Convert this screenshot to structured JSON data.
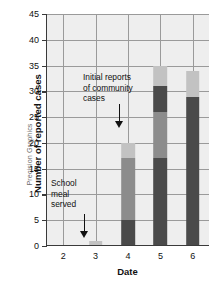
{
  "chart_data": {
    "type": "bar",
    "stacked": true,
    "title": "",
    "xlabel": "Date",
    "ylabel": "Number of reported cases",
    "categories": [
      "2",
      "3",
      "4",
      "5",
      "6"
    ],
    "ylim": [
      0,
      45
    ],
    "ytick_step": 5,
    "yticks": [
      "0",
      "5",
      "10",
      "15",
      "20",
      "25",
      "30",
      "35",
      "40",
      "45"
    ],
    "grid": true,
    "legend": "none",
    "series": [
      {
        "name": "segment-1",
        "color": "#4a4a4a",
        "values": [
          0,
          0,
          5,
          17,
          24
        ]
      },
      {
        "name": "segment-2",
        "color": "#8c8c8c",
        "values": [
          0,
          0,
          12,
          9,
          0
        ]
      },
      {
        "name": "segment-3",
        "color": "#4a4a4a",
        "values": [
          0,
          0,
          0,
          5,
          5
        ]
      },
      {
        "name": "segment-4",
        "color": "#c2c2c2",
        "values": [
          0,
          1,
          3,
          4,
          5
        ]
      }
    ],
    "totals": [
      0,
      1,
      20,
      35,
      34
    ],
    "annotations": [
      {
        "name": "school-meal",
        "text_lines": [
          "School",
          "meal",
          "served"
        ],
        "at_category": "2",
        "arrow": "down"
      },
      {
        "name": "initial-reports",
        "text_lines": [
          "Initial reports",
          "of community",
          "cases"
        ],
        "at_category": "4",
        "arrow": "down"
      }
    ]
  },
  "credit": "Precision Graphics",
  "colors": {
    "plot_background": "#eeeeee",
    "gridline": "#9a9a9a",
    "axis": "#3a3a3a",
    "dark_segment": "#4a4a4a",
    "medium_segment": "#8c8c8c",
    "light_segment": "#c2c2c2",
    "text": "#111111"
  }
}
